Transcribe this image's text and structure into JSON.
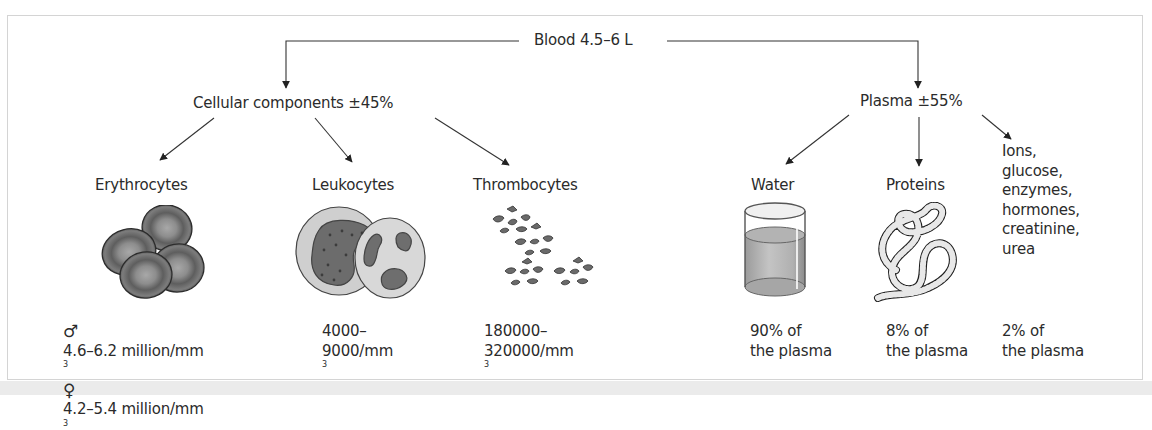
{
  "diagram": {
    "root": {
      "label": "Blood 4.5–6 L"
    },
    "branches": [
      {
        "label": "Cellular components ±45%",
        "children": [
          {
            "label": "Erythrocytes",
            "illustration": "erythrocytes-illustration",
            "values": [
              {
                "symbol": "♂",
                "symbol_name": "male-symbol",
                "text": "4.6–6.2 million/mm",
                "sup": "3"
              },
              {
                "symbol": "♀",
                "symbol_name": "female-symbol",
                "text": "4.2–5.4 million/mm",
                "sup": "3"
              }
            ]
          },
          {
            "label": "Leukocytes",
            "illustration": "leukocytes-illustration",
            "values": [
              {
                "text": "4000–"
              },
              {
                "text": "9000/mm",
                "sup": "3"
              }
            ]
          },
          {
            "label": "Thrombocytes",
            "illustration": "thrombocytes-illustration",
            "values": [
              {
                "text": "180000–"
              },
              {
                "text": "320000/mm",
                "sup": "3"
              }
            ]
          }
        ]
      },
      {
        "label": "Plasma ±55%",
        "children": [
          {
            "label": "Water",
            "illustration": "water-glass-illustration",
            "values": [
              {
                "text": "90% of"
              },
              {
                "text": "the plasma"
              }
            ]
          },
          {
            "label": "Proteins",
            "illustration": "protein-coil-illustration",
            "values": [
              {
                "text": "8% of"
              },
              {
                "text": "the plasma"
              }
            ]
          },
          {
            "label_lines": [
              "Ions,",
              "glucose,",
              "enzymes,",
              "hormones,",
              "creatinine,",
              "urea"
            ],
            "values": [
              {
                "text": "2% of"
              },
              {
                "text": "the plasma"
              }
            ]
          }
        ]
      }
    ]
  },
  "colors": {
    "line": "#2a2a2a",
    "frame_border": "#d4d4d4",
    "footer_band": "#ebebeb",
    "cell_gray": "#6e6e6e"
  }
}
